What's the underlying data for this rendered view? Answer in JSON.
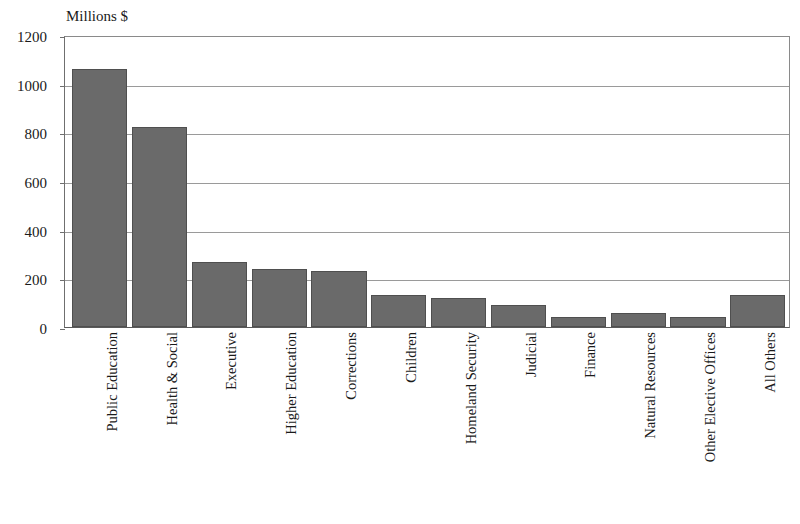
{
  "chart_data": {
    "type": "bar",
    "title": "",
    "xlabel": "",
    "ylabel": "Millions $",
    "ylim": [
      0,
      1200
    ],
    "yticks": [
      0,
      200,
      400,
      600,
      800,
      1000,
      1200
    ],
    "ytick_labels": [
      "0",
      "200",
      "400",
      "600",
      "800",
      "1000",
      "1200"
    ],
    "grid": true,
    "legend": false,
    "bar_color": "#6a6a6a",
    "bar_edge_color": "#4f4f4f",
    "categories": [
      "Public Education",
      "Health & Social",
      "Executive",
      "Higher Education",
      "Corrections",
      "Children",
      "Homeland Security",
      "Judicial",
      "Finance",
      "Natural Resources",
      "Other Elective Offices",
      "All Others"
    ],
    "values": [
      1060,
      820,
      268,
      238,
      230,
      130,
      120,
      92,
      40,
      58,
      40,
      132
    ]
  }
}
